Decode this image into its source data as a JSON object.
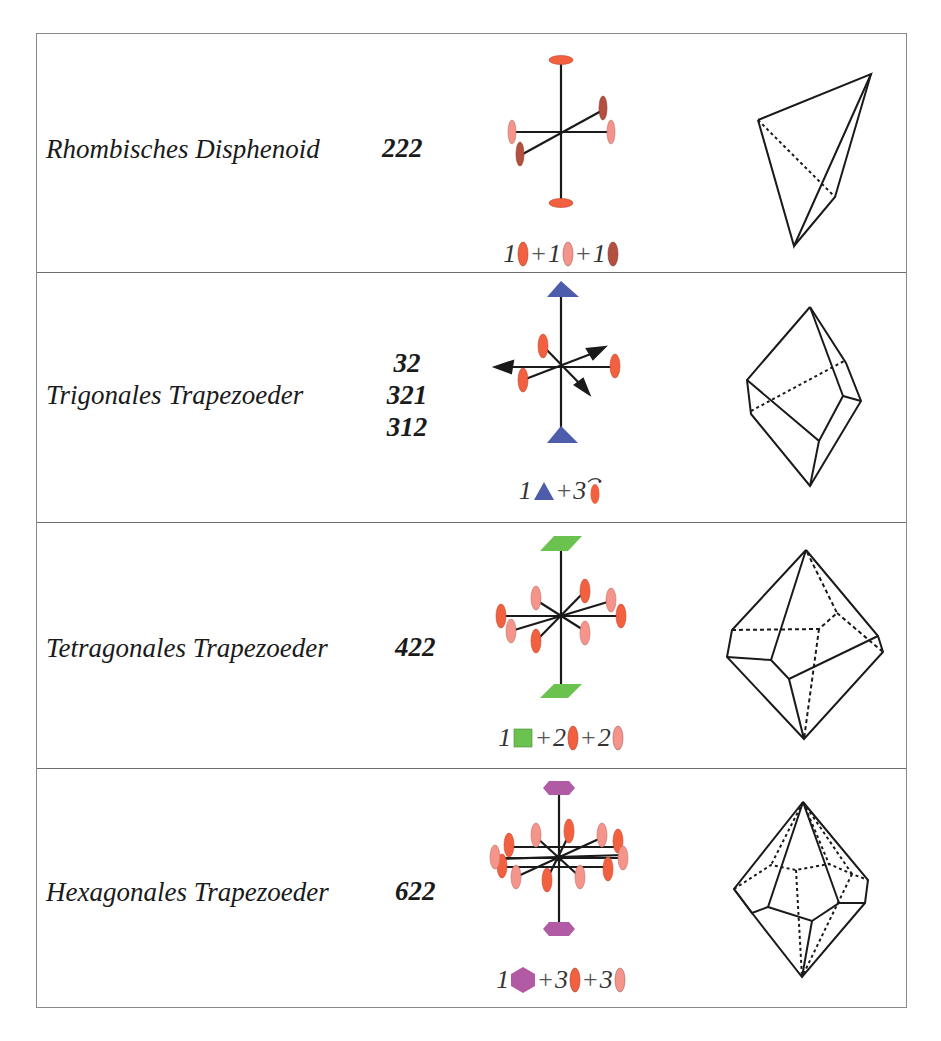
{
  "rows": [
    {
      "name": "Rhombisches Disphenoid",
      "symbols": [
        "222"
      ],
      "formula": {
        "c1": "1",
        "op1": "+",
        "c2": "1",
        "op2": "+",
        "c3": "1"
      },
      "symbol_colors": {
        "a": "#f2603f",
        "b": "#f4948a",
        "c": "#b4503f"
      }
    },
    {
      "name": "Trigonales Trapezoeder",
      "symbols": [
        "32",
        "321",
        "312"
      ],
      "formula": {
        "c1": "1",
        "op1": "+",
        "c2": "3"
      },
      "symbol_colors": {
        "a": "#4d5cab",
        "b": "#f2603f"
      }
    },
    {
      "name": "Tetragonales Trapezoeder",
      "symbols": [
        "422"
      ],
      "formula": {
        "c1": "1",
        "op1": "+",
        "c2": "2",
        "op2": "+",
        "c3": "2"
      },
      "symbol_colors": {
        "a": "#6bc24f",
        "b": "#f2603f",
        "c": "#f4948a"
      }
    },
    {
      "name": "Hexagonales Trapezoeder",
      "symbols": [
        "622"
      ],
      "formula": {
        "c1": "1",
        "op1": "+",
        "c2": "3",
        "op2": "+",
        "c3": "3"
      },
      "symbol_colors": {
        "a": "#b25ba5",
        "b": "#f2603f",
        "c": "#f4948a"
      }
    }
  ]
}
